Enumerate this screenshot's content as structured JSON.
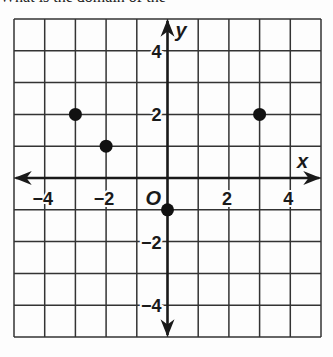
{
  "header": {
    "text": "What is the domain of the"
  },
  "chart_data": {
    "type": "scatter",
    "title": "",
    "xlabel": "x",
    "ylabel": "y",
    "origin_label": "O",
    "xlim": [
      -5,
      5
    ],
    "ylim": [
      -5,
      5
    ],
    "grid": true,
    "x_ticks": [
      -4,
      -2,
      2,
      4
    ],
    "y_ticks": [
      4,
      2,
      -2,
      -4
    ],
    "x_tick_labels": [
      "−4",
      "−2",
      "2",
      "4"
    ],
    "y_tick_labels": [
      "4",
      "2",
      "−2",
      "−4"
    ],
    "points": [
      {
        "x": -3,
        "y": 2
      },
      {
        "x": -2,
        "y": 1
      },
      {
        "x": 3,
        "y": 2
      },
      {
        "x": 0,
        "y": -1
      }
    ],
    "colors": {
      "grid": "#333333",
      "axis": "#1a1a1a",
      "point": "#111111"
    }
  }
}
